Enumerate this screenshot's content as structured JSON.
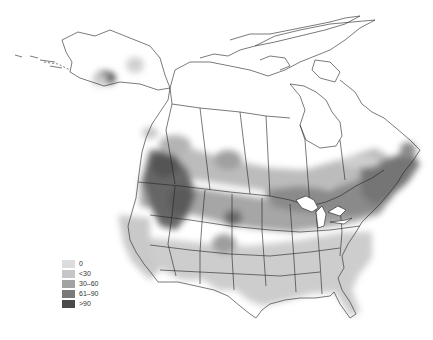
{
  "map": {
    "region": "North America (Canada, United States, Alaska)",
    "projection": "conic",
    "background": "#ffffff",
    "outline_color": "#222222",
    "legend": {
      "position": "lower-left",
      "items": [
        {
          "label": "0",
          "color": "#dcdcdc"
        },
        {
          "label": "<30",
          "color": "#c6c6c6"
        },
        {
          "label": "30–60",
          "color": "#a2a2a2"
        },
        {
          "label": "61–90",
          "color": "#7a7a7a"
        },
        {
          "label": ">90",
          "color": "#4a4a4a"
        }
      ]
    },
    "density_regions": [
      {
        "area": "Southern Alaska coast (Anchorage)",
        "class": ">90"
      },
      {
        "area": "Interior Alaska",
        "class": "0"
      },
      {
        "area": "Pacific Northwest / Washington & Oregon",
        "class": ">90"
      },
      {
        "area": "Southern British Columbia & Alberta",
        "class": "61-90"
      },
      {
        "area": "Southern Saskatchewan & Manitoba",
        "class": "30-60"
      },
      {
        "area": "Great Lakes & Ontario",
        "class": "30-60"
      },
      {
        "area": "New England & Maritimes",
        "class": "61-90"
      },
      {
        "area": "Colorado Rockies",
        "class": "30-60"
      },
      {
        "area": "Black Hills / South Dakota",
        "class": "61-90"
      },
      {
        "area": "Southwest & Texas",
        "class": "<30"
      },
      {
        "area": "Southeast US",
        "class": "<30"
      },
      {
        "area": "Northern Canada / Arctic",
        "class": "none"
      }
    ]
  }
}
